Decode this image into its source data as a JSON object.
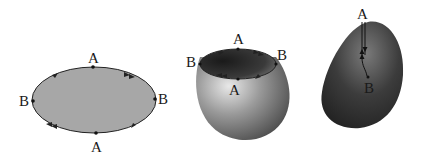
{
  "figure": {
    "panels": [
      {
        "name": "flat-disk",
        "labels": {
          "top": "A",
          "bottom": "A",
          "left": "B",
          "right": "B"
        },
        "fill_color": "#a7a7a7"
      },
      {
        "name": "bowl",
        "labels": {
          "top": "A",
          "bottom": "A",
          "left": "B",
          "right": "B"
        },
        "fill_color": "#8c8c8c"
      },
      {
        "name": "closed-surface",
        "labels": {
          "top": "A",
          "bottom": "B"
        },
        "fill_color": "#5a5a5a"
      }
    ],
    "stroke_color": "#222222"
  }
}
